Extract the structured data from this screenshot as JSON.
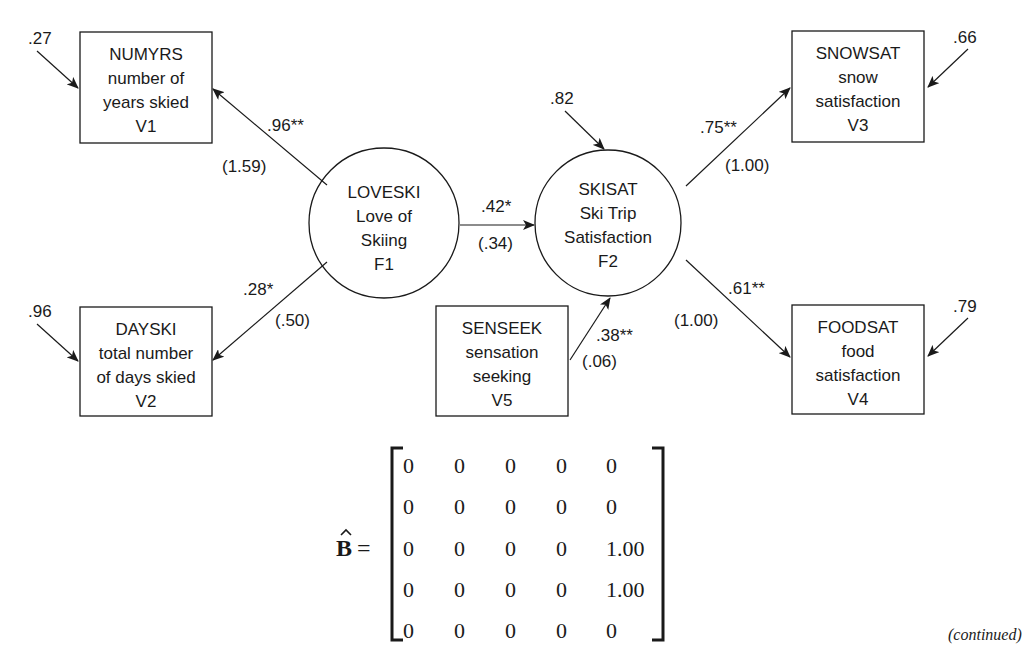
{
  "nodes": {
    "v1": {
      "lines": [
        "NUMYRS",
        "number of",
        "years skied",
        "V1"
      ],
      "error": ".27"
    },
    "v2": {
      "lines": [
        "DAYSKI",
        "total number",
        "of days skied",
        "V2"
      ],
      "error": ".96"
    },
    "v3": {
      "lines": [
        "SNOWSAT",
        "snow",
        "satisfaction",
        "V3"
      ],
      "error": ".66"
    },
    "v4": {
      "lines": [
        "FOODSAT",
        "food",
        "satisfaction",
        "V4"
      ],
      "error": ".79"
    },
    "v5": {
      "lines": [
        "SENSEEK",
        "sensation",
        "seeking",
        "V5"
      ]
    },
    "f1": {
      "lines": [
        "LOVESKI",
        "Love of",
        "Skiing",
        "F1"
      ]
    },
    "f2": {
      "lines": [
        "SKISAT",
        "Ski Trip",
        "Satisfaction",
        "F2"
      ],
      "disturbance": ".82"
    }
  },
  "paths": {
    "f1_v1": {
      "std": ".96**",
      "unstd": "(1.59)"
    },
    "f1_v2": {
      "std": ".28*",
      "unstd": "(.50)"
    },
    "f1_f2": {
      "std": ".42*",
      "unstd": "(.34)"
    },
    "v5_f2": {
      "std": ".38**",
      "unstd": "(.06)"
    },
    "f2_v3": {
      "std": ".75**",
      "unstd": "(1.00)"
    },
    "f2_v4": {
      "std": ".61**",
      "unstd": "(1.00)"
    }
  },
  "matrix": {
    "symbol": "B",
    "equals": "=",
    "rows": [
      [
        "0",
        "0",
        "0",
        "0",
        "0"
      ],
      [
        "0",
        "0",
        "0",
        "0",
        "0"
      ],
      [
        "0",
        "0",
        "0",
        "0",
        "1.00"
      ],
      [
        "0",
        "0",
        "0",
        "0",
        "1.00"
      ],
      [
        "0",
        "0",
        "0",
        "0",
        "0"
      ]
    ]
  },
  "footer": {
    "continued": "(continued)"
  }
}
